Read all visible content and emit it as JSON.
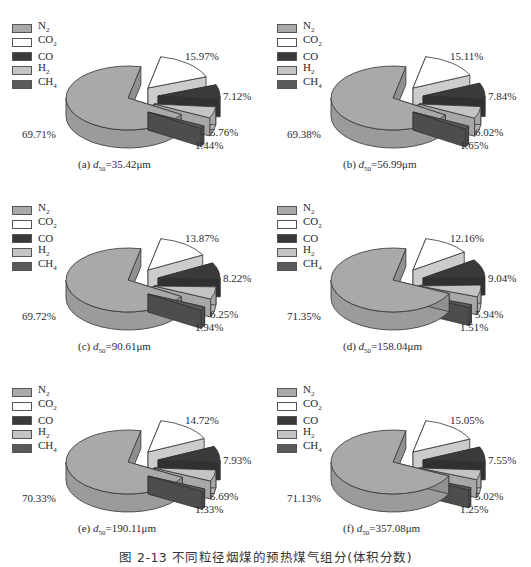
{
  "figure_caption": "图 2-13   不同粒径烟煤的预热煤气组分(体积分数)",
  "legend": [
    {
      "key": "N2",
      "label": "N",
      "sub": "2",
      "color": "#a9a9a9"
    },
    {
      "key": "CO2",
      "label": "CO",
      "sub": "2",
      "color": "#ffffff"
    },
    {
      "key": "CO",
      "label": "CO",
      "sub": "",
      "color": "#3a3a3a"
    },
    {
      "key": "H2",
      "label": "H",
      "sub": "2",
      "color": "#c4c4c4"
    },
    {
      "key": "CH4",
      "label": "CH",
      "sub": "4",
      "color": "#5a5a5a"
    }
  ],
  "chart_data": [
    {
      "type": "pie",
      "title": "(a) d50=35.42μm",
      "panel": "(a)",
      "d50": "=35.42μm",
      "categories": [
        "N2",
        "CO2",
        "CO",
        "H2",
        "CH4"
      ],
      "values": [
        69.71,
        15.97,
        7.12,
        5.76,
        1.44
      ],
      "labels": [
        "69.71%",
        "15.97%",
        "7.12%",
        "5.76%",
        "1.44%"
      ],
      "legend_position": "upper-left",
      "exploded": [
        "CO2",
        "CO",
        "H2",
        "CH4"
      ]
    },
    {
      "type": "pie",
      "title": "(b) d50=56.99μm",
      "panel": "(b)",
      "d50": "=56.99μm",
      "categories": [
        "N2",
        "CO2",
        "CO",
        "H2",
        "CH4"
      ],
      "values": [
        69.38,
        15.11,
        7.84,
        6.02,
        1.65
      ],
      "labels": [
        "69.38%",
        "15.11%",
        "7.84%",
        "6.02%",
        "1.65%"
      ],
      "legend_position": "upper-left",
      "exploded": [
        "CO2",
        "CO",
        "H2",
        "CH4"
      ]
    },
    {
      "type": "pie",
      "title": "(c) d50=90.61μm",
      "panel": "(c)",
      "d50": "=90.61μm",
      "categories": [
        "N2",
        "CO2",
        "CO",
        "H2",
        "CH4"
      ],
      "values": [
        69.72,
        13.87,
        8.22,
        6.25,
        1.94
      ],
      "labels": [
        "69.72%",
        "13.87%",
        "8.22%",
        "6.25%",
        "1.94%"
      ],
      "legend_position": "upper-left",
      "exploded": [
        "CO2",
        "CO",
        "H2",
        "CH4"
      ]
    },
    {
      "type": "pie",
      "title": "(d) d50=158.04μm",
      "panel": "(d)",
      "d50": "=158.04μm",
      "categories": [
        "N2",
        "CO2",
        "CO",
        "H2",
        "CH4"
      ],
      "values": [
        71.35,
        12.16,
        9.04,
        5.94,
        1.51
      ],
      "labels": [
        "71.35%",
        "12.16%",
        "9.04%",
        "5.94%",
        "1.51%"
      ],
      "legend_position": "upper-left",
      "exploded": [
        "CO2",
        "CO",
        "H2",
        "CH4"
      ]
    },
    {
      "type": "pie",
      "title": "(e) d50=190.11μm",
      "panel": "(e)",
      "d50": "=190.11μm",
      "categories": [
        "N2",
        "CO2",
        "CO",
        "H2",
        "CH4"
      ],
      "values": [
        70.33,
        14.72,
        7.93,
        5.69,
        1.33
      ],
      "labels": [
        "70.33%",
        "14.72%",
        "7.93%",
        "5.69%",
        "1.33%"
      ],
      "legend_position": "upper-left",
      "exploded": [
        "CO2",
        "CO",
        "H2",
        "CH4"
      ]
    },
    {
      "type": "pie",
      "title": "(f) d50=357.08μm",
      "panel": "(f)",
      "d50": "=357.08μm",
      "categories": [
        "N2",
        "CO2",
        "CO",
        "H2",
        "CH4"
      ],
      "values": [
        71.13,
        15.05,
        7.55,
        5.02,
        1.25
      ],
      "labels": [
        "71.13%",
        "15.05%",
        "7.55%",
        "5.02%",
        "1.25%"
      ],
      "legend_position": "upper-left",
      "exploded": [
        "CO2",
        "CO",
        "H2",
        "CH4"
      ]
    }
  ]
}
